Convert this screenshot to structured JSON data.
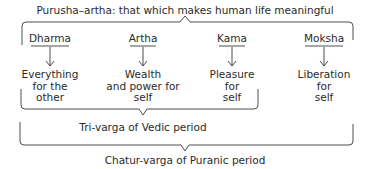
{
  "title": "Purusha–artha: that which makes human life meaningful",
  "purusharthas": [
    {
      "name": "Dharma",
      "description": [
        "Everything",
        "for the",
        "other"
      ]
    },
    {
      "name": "Artha",
      "description": [
        "Wealth",
        "and power for",
        "self"
      ]
    },
    {
      "name": "Kama",
      "description": [
        "Pleasure",
        "for",
        "self"
      ]
    },
    {
      "name": "Moksha",
      "description": [
        "Liberation",
        "for",
        "self"
      ]
    }
  ],
  "groups": {
    "tri_varga": "Tri-varga of Vedic period",
    "chatur_varga": "Chatur-varga of Puranic period"
  }
}
